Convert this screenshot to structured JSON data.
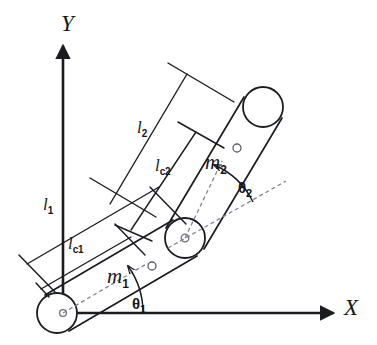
{
  "figure": {
    "stroke_color": "#1b1c20",
    "dash_color": "#7c7e86",
    "background": "#ffffff"
  },
  "axes": {
    "x_label": "X",
    "y_label": "Y",
    "origin_label": ""
  },
  "links": [
    {
      "name": "link-1",
      "length_label": "l",
      "length_sub": "1",
      "com_label": "l",
      "com_sub": "c1",
      "mass_label": "m",
      "mass_sub": "1",
      "angle_label": "θ",
      "angle_sub": "1",
      "angle_deg": 37
    },
    {
      "name": "link-2",
      "length_label": "l",
      "length_sub": "2",
      "com_label": "l",
      "com_sub": "c2",
      "mass_label": "m",
      "mass_sub": "2",
      "angle_label": "θ",
      "angle_sub": "2",
      "angle_deg": 37
    }
  ],
  "labels": {
    "l1": "l",
    "l1_sub": "1",
    "lc1": "l",
    "lc1_sub": "c1",
    "m1": "m",
    "m1_sub": "1",
    "theta1": "θ",
    "theta1_sub": "1",
    "l2": "l",
    "l2_sub": "2",
    "lc2": "l",
    "lc2_sub": "c2",
    "m2": "m",
    "m2_sub": "2",
    "theta2": "θ",
    "theta2_sub": "2",
    "x_axis": "X",
    "y_axis": "Y"
  },
  "joints": [
    {
      "name": "base-joint",
      "cx": 57,
      "cy": 313,
      "r": 20
    },
    {
      "name": "elbow-joint",
      "cx": 185,
      "cy": 238,
      "r": 20
    },
    {
      "name": "end-effector-joint",
      "cx": 263,
      "cy": 107,
      "r": 20
    }
  ],
  "com_markers": [
    {
      "name": "com-marker-link-1",
      "cx": 152,
      "cy": 266,
      "r": 4
    },
    {
      "name": "com-marker-link-2",
      "cx": 237,
      "cy": 148,
      "r": 4
    }
  ]
}
